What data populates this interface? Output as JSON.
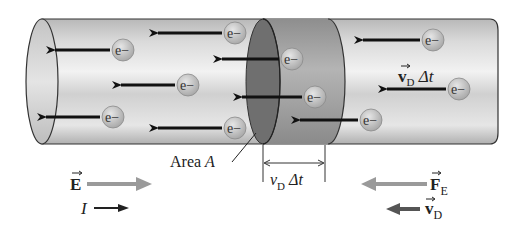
{
  "figure": {
    "electron_label": "e−",
    "labels": {
      "area": "Area ",
      "area_symbol": "A",
      "drift_distance_in_wire": "v⃗D Δt",
      "dimension_v": "v",
      "dimension_sub": "D",
      "dimension_delta_t": " Δt",
      "field": "E",
      "current": "I",
      "force": "F",
      "force_sub": "E",
      "velocity": "v",
      "velocity_sub": "D",
      "vd_inwire_v": "v",
      "vd_inwire_sub": "D",
      "vd_inwire_dt": " Δt"
    },
    "colors": {
      "wire_light": "#e8e8e8",
      "wire_mid": "#bdbdbd",
      "slab": "#9a9a9a",
      "area_disk": "#6f6f6f",
      "electron_fill": "#c9c9c9",
      "arrow_dark": "#111111",
      "arrow_gray": "#9a9a9a",
      "arrow_vd": "#555555"
    },
    "electrons": [
      {
        "x": 235,
        "y": 33
      },
      {
        "x": 123,
        "y": 50
      },
      {
        "x": 188,
        "y": 85
      },
      {
        "x": 113,
        "y": 117
      },
      {
        "x": 235,
        "y": 128
      },
      {
        "x": 292,
        "y": 59
      },
      {
        "x": 315,
        "y": 97
      },
      {
        "x": 371,
        "y": 120
      },
      {
        "x": 433,
        "y": 40
      },
      {
        "x": 459,
        "y": 89
      }
    ]
  }
}
